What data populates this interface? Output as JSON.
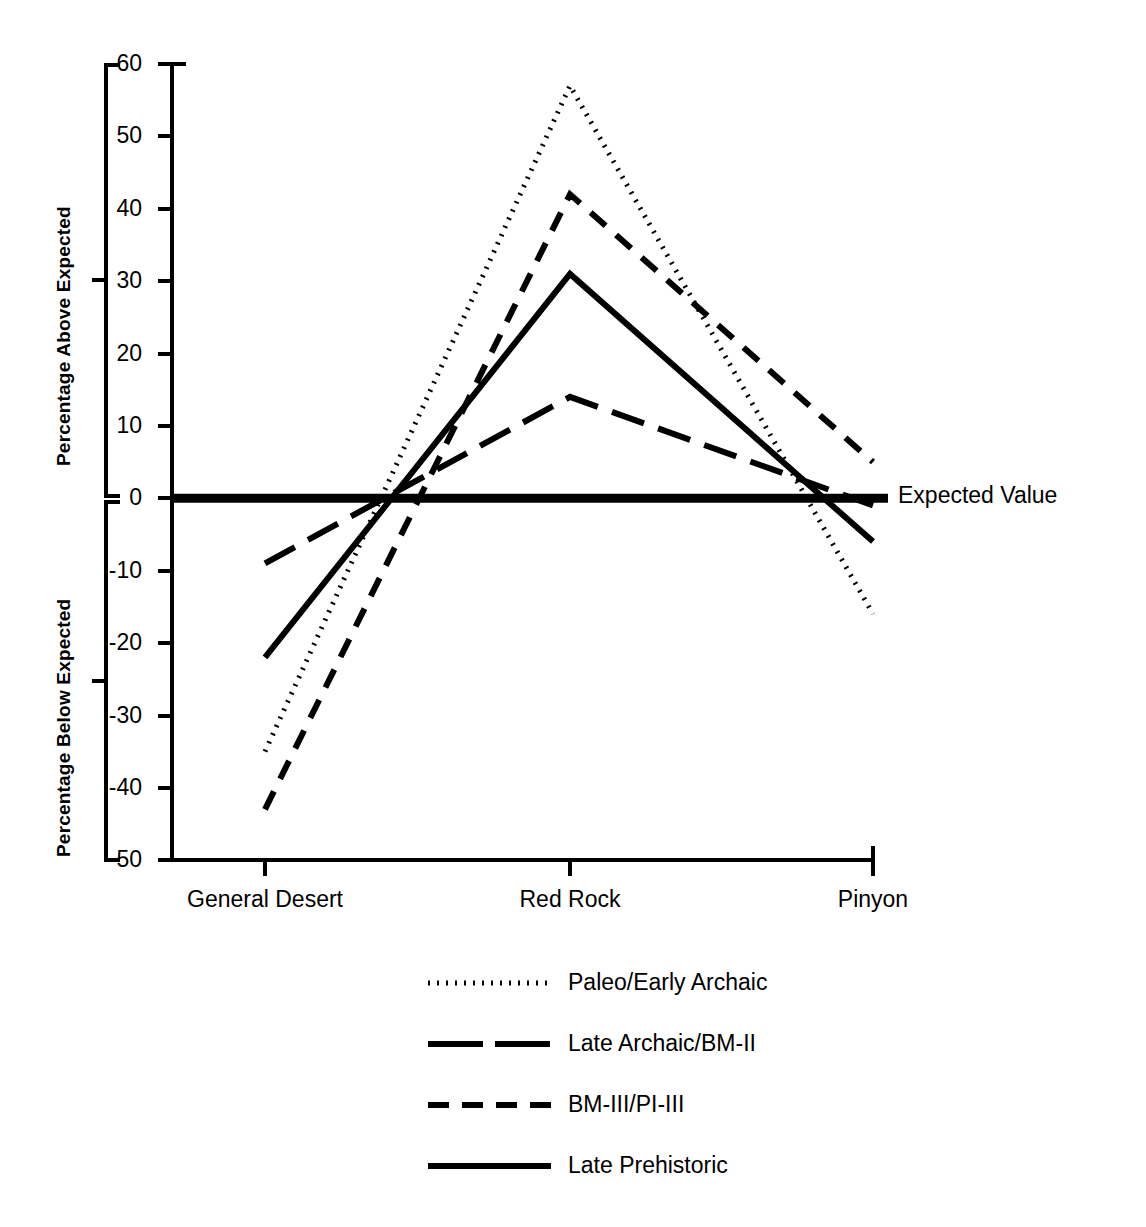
{
  "chart_data": {
    "type": "line",
    "title": "",
    "xlabel": "",
    "ylabel_above": "Percentage Above Expected",
    "ylabel_below": "Percentage Below Expected",
    "categories": [
      "General Desert",
      "Red Rock",
      "Pinyon"
    ],
    "ylim": [
      -50,
      60
    ],
    "yticks": [
      60,
      50,
      40,
      30,
      20,
      10,
      0,
      -10,
      -20,
      -30,
      -40,
      -50
    ],
    "ytick_labels": [
      "60",
      "50",
      "40",
      "30",
      "20",
      "10",
      "0",
      "-10",
      "-20",
      "-30",
      "-40",
      "-50"
    ],
    "grid": false,
    "legend_position": "below-axes-center",
    "annotations": [
      {
        "name": "expected-value",
        "text": "Expected Value",
        "y_value": 0
      }
    ],
    "reference_line": {
      "value": 0,
      "label": "Expected Value",
      "style": "solid-thick"
    },
    "series": [
      {
        "name": "Paleo/Early Archaic",
        "style": "dotted",
        "values": [
          -35,
          57,
          -16
        ]
      },
      {
        "name": "Late Archaic/BM-II",
        "style": "long-dash",
        "values": [
          -9,
          14,
          -1
        ]
      },
      {
        "name": "BM-III/PI-III",
        "style": "dash",
        "values": [
          -43,
          42,
          5
        ]
      },
      {
        "name": "Late Prehistoric",
        "style": "solid",
        "values": [
          -22,
          31,
          -6
        ]
      }
    ]
  },
  "axes": {
    "ytick_labels": [
      "60",
      "50",
      "40",
      "30",
      "20",
      "10",
      "0",
      "-10",
      "-20",
      "-30",
      "-40",
      "-50"
    ],
    "xtick_labels": [
      "General Desert",
      "Red Rock",
      "Pinyon"
    ],
    "ylabel_above": "Percentage Above Expected",
    "ylabel_below": "Percentage Below Expected"
  },
  "legend": {
    "entries": [
      {
        "label": "Paleo/Early Archaic",
        "style": "dotted"
      },
      {
        "label": "Late Archaic/BM-II",
        "style": "long-dash"
      },
      {
        "label": "BM-III/PI-III",
        "style": "dash"
      },
      {
        "label": "Late Prehistoric",
        "style": "solid"
      }
    ]
  },
  "annotation": {
    "expected_value": "Expected Value"
  },
  "colors": {
    "ink": "#000000",
    "background": "#ffffff"
  }
}
